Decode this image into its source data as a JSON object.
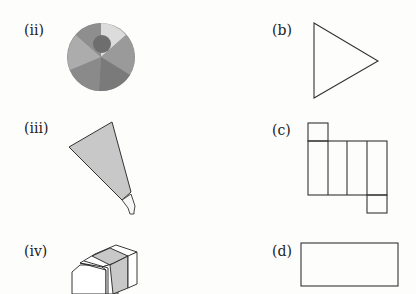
{
  "labels": {
    "ii": "(ii)",
    "iii": "(iii)",
    "iv": "(iv)",
    "b": "(b)",
    "c": "(c)",
    "d": "(d)"
  },
  "objects": {
    "ii": "beach-ball",
    "iii": "ice-cream-cone-shaped-pen",
    "iv": "eraser-box"
  },
  "nets": {
    "b": "triangle",
    "c": "cuboid-net",
    "d": "rectangle"
  },
  "colors": {
    "stroke": "#333333",
    "fill_grey": "#c8c8c8",
    "ball_dark": "#777777",
    "ball_mid": "#909090",
    "ball_light": "#b0b0b0",
    "ball_lightest": "#dcdcdc"
  }
}
